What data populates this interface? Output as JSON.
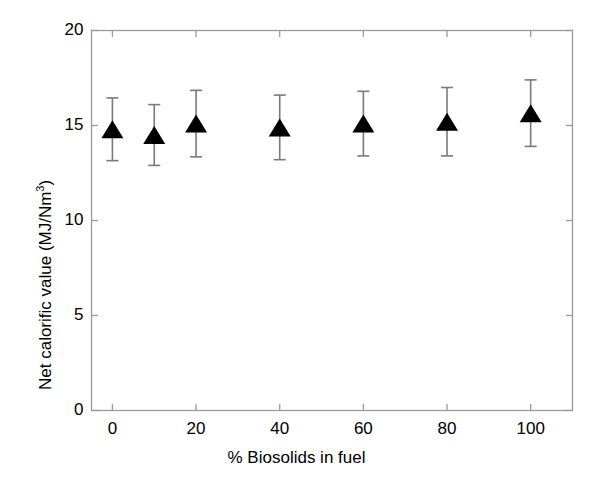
{
  "chart_data": {
    "type": "scatter",
    "title": "",
    "xlabel": "% Biosolids in fuel",
    "ylabel": "Net calorific value (MJ/Nm3)",
    "ylabel_text": "Net calorific value (MJ/Nm",
    "ylabel_sup": "3",
    "ylabel_tail": ")",
    "xlim": [
      -5,
      110
    ],
    "ylim": [
      0,
      20
    ],
    "grid": false,
    "legend": "none",
    "marker": "filled-triangle",
    "marker_color": "#000000",
    "errorbar_color": "#7a7a7a",
    "axis_color": "#9a9a9a",
    "background": "#ffffff",
    "x": [
      0,
      10,
      20,
      40,
      60,
      80,
      100
    ],
    "y": [
      14.8,
      14.5,
      15.1,
      14.9,
      15.1,
      15.2,
      15.65
    ],
    "yerr": [
      1.65,
      1.6,
      1.75,
      1.7,
      1.7,
      1.8,
      1.75
    ],
    "xticks": [
      0,
      20,
      40,
      60,
      80,
      100
    ],
    "xtick_labels": [
      "0",
      "20",
      "40",
      "60",
      "80",
      "100"
    ],
    "yticks": [
      0,
      5,
      10,
      15,
      20
    ],
    "ytick_labels": [
      "0",
      "5",
      "10",
      "15",
      "20"
    ],
    "series": [
      {
        "name": "Net calorific value",
        "points": [
          {
            "x": 0,
            "y": 14.8,
            "err": 1.65
          },
          {
            "x": 10,
            "y": 14.5,
            "err": 1.6
          },
          {
            "x": 20,
            "y": 15.1,
            "err": 1.75
          },
          {
            "x": 40,
            "y": 14.9,
            "err": 1.7
          },
          {
            "x": 60,
            "y": 15.1,
            "err": 1.7
          },
          {
            "x": 80,
            "y": 15.2,
            "err": 1.8
          },
          {
            "x": 100,
            "y": 15.65,
            "err": 1.75
          }
        ]
      }
    ]
  }
}
